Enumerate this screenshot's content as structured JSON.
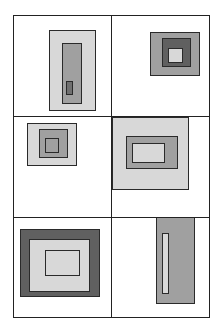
{
  "diagram": {
    "type": "nested-rectangles-grid",
    "grid": {
      "rows": 3,
      "cols": 2,
      "left": 13,
      "right": 209,
      "top": 15,
      "bottom": 317,
      "col_divider": 111,
      "row_dividers": [
        116,
        217
      ]
    },
    "colors": {
      "light": "#d8d8d8",
      "medium": "#a0a0a0",
      "dark": "#606060",
      "darker": "#707070",
      "border": "#2a2a2a",
      "background": "#ffffff"
    },
    "cells": [
      {
        "id": "cell-1",
        "rects": [
          {
            "x": 49,
            "y": 30,
            "w": 47,
            "h": 81,
            "fill": "#d8d8d8"
          },
          {
            "x": 62,
            "y": 43,
            "w": 20,
            "h": 61,
            "fill": "#a0a0a0"
          },
          {
            "x": 66,
            "y": 81,
            "w": 7,
            "h": 14,
            "fill": "#707070"
          }
        ]
      },
      {
        "id": "cell-2",
        "rects": [
          {
            "x": 150,
            "y": 32,
            "w": 50,
            "h": 44,
            "fill": "#a0a0a0"
          },
          {
            "x": 162,
            "y": 38,
            "w": 29,
            "h": 29,
            "fill": "#606060"
          },
          {
            "x": 168,
            "y": 48,
            "w": 15,
            "h": 15,
            "fill": "#d8d8d8"
          }
        ]
      },
      {
        "id": "cell-3",
        "rects": [
          {
            "x": 27,
            "y": 123,
            "w": 50,
            "h": 43,
            "fill": "#d8d8d8"
          },
          {
            "x": 39,
            "y": 129,
            "w": 29,
            "h": 29,
            "fill": "#a0a0a0"
          },
          {
            "x": 45,
            "y": 138,
            "w": 14,
            "h": 15,
            "fill": "#a0a0a0"
          }
        ]
      },
      {
        "id": "cell-4",
        "rects": [
          {
            "x": 112,
            "y": 117,
            "w": 77,
            "h": 73,
            "fill": "#d8d8d8"
          },
          {
            "x": 126,
            "y": 136,
            "w": 52,
            "h": 33,
            "fill": "#a0a0a0"
          },
          {
            "x": 132,
            "y": 143,
            "w": 33,
            "h": 20,
            "fill": "#d8d8d8"
          }
        ]
      },
      {
        "id": "cell-5",
        "rects": [
          {
            "x": 20,
            "y": 229,
            "w": 80,
            "h": 68,
            "fill": "#606060"
          },
          {
            "x": 29,
            "y": 239,
            "w": 61,
            "h": 53,
            "fill": "#d8d8d8"
          },
          {
            "x": 45,
            "y": 250,
            "w": 35,
            "h": 26,
            "fill": "#d8d8d8"
          }
        ]
      },
      {
        "id": "cell-6",
        "rects": [
          {
            "x": 156,
            "y": 217,
            "w": 39,
            "h": 87,
            "fill": "#a0a0a0"
          },
          {
            "x": 162,
            "y": 233,
            "w": 7,
            "h": 61,
            "fill": "#d8d8d8"
          }
        ]
      }
    ]
  }
}
